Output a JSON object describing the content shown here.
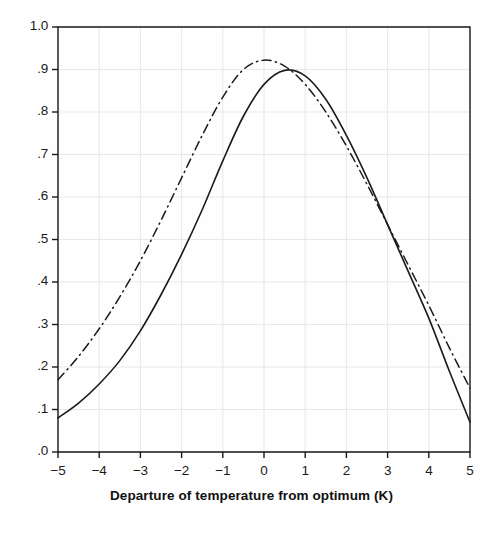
{
  "chart_data": {
    "type": "line",
    "title": "",
    "xlabel": "Departure of temperature from optimum (K)",
    "ylabel": "",
    "xlim": [
      -5,
      5
    ],
    "ylim": [
      0.0,
      1.0
    ],
    "grid": true,
    "legend_position": "none",
    "x_ticks": [
      -5,
      -4,
      -3,
      -2,
      -1,
      0,
      1,
      2,
      3,
      4,
      5
    ],
    "x_tick_labels": [
      "−5",
      "−4",
      "−3",
      "−2",
      "−1",
      "0",
      "1",
      "2",
      "3",
      "4",
      "5"
    ],
    "y_ticks": [
      0.0,
      0.1,
      0.2,
      0.3,
      0.4,
      0.5,
      0.6,
      0.7,
      0.8,
      0.9,
      1.0
    ],
    "y_tick_labels": [
      ".0",
      ".1",
      ".2",
      ".3",
      ".4",
      ".5",
      ".6",
      ".7",
      ".8",
      ".9",
      "1.0"
    ],
    "x": [
      -5,
      -4.5,
      -4,
      -3.5,
      -3,
      -2.5,
      -2,
      -1.5,
      -1,
      -0.5,
      0,
      0.5,
      1,
      1.5,
      2,
      2.5,
      3,
      3.5,
      4,
      4.5,
      5
    ],
    "series": [
      {
        "name": "solid-curve",
        "style": "solid",
        "color": "#1a1a1a",
        "peak_x": 0.2,
        "peak_y": 0.9,
        "values": [
          0.08,
          0.115,
          0.16,
          0.215,
          0.285,
          0.37,
          0.465,
          0.57,
          0.685,
          0.79,
          0.865,
          0.898,
          0.885,
          0.83,
          0.745,
          0.645,
          0.535,
          0.425,
          0.315,
          0.19,
          0.07
        ]
      },
      {
        "name": "dash-dot-curve",
        "style": "dash-dot",
        "color": "#1a1a1a",
        "peak_x": -0.1,
        "peak_y": 0.923,
        "values": [
          0.17,
          0.225,
          0.29,
          0.365,
          0.45,
          0.545,
          0.645,
          0.745,
          0.835,
          0.9,
          0.922,
          0.908,
          0.865,
          0.8,
          0.72,
          0.63,
          0.535,
          0.44,
          0.345,
          0.245,
          0.15
        ]
      }
    ],
    "colors": {
      "ink": "#1a1a1a",
      "grid": "#e8e6ef",
      "background": "#fefefe"
    }
  }
}
